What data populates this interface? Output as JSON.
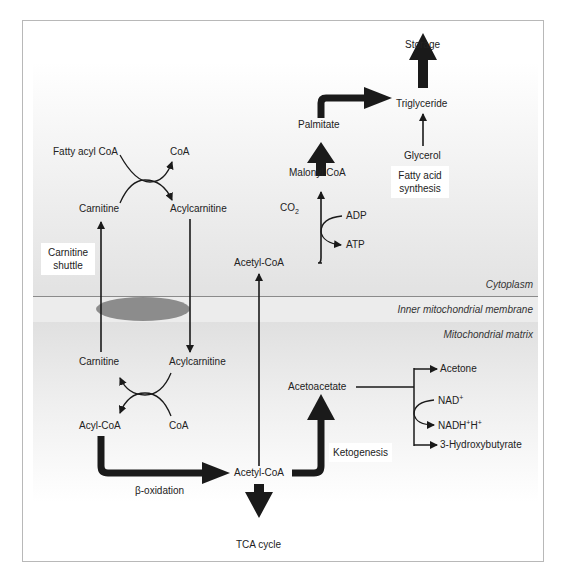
{
  "regions": {
    "cytoplasm": "Cytoplasm",
    "membrane": "Inner mitochondrial membrane",
    "matrix": "Mitochondrial matrix"
  },
  "cytoplasm_nodes": {
    "fatty_acyl_coa": "Fatty acyl CoA",
    "coa_top": "CoA",
    "carnitine_top": "Carnitine",
    "acylcarnitine_top": "Acylcarnitine",
    "acetyl_coa_top": "Acetyl-CoA",
    "co2_base": "CO",
    "co2_sub": "2",
    "adp": "ADP",
    "atp": "ATP",
    "malonyl_coa": "Malonyl CoA",
    "palmitate": "Palmitate",
    "triglyceride": "Triglyceride",
    "storage": "Storage",
    "glycerol": "Glycerol"
  },
  "boxes": {
    "carnitine_shuttle_line1": "Carnitine",
    "carnitine_shuttle_line2": "shuttle",
    "fatty_acid_synthesis_line1": "Fatty acid",
    "fatty_acid_synthesis_line2": "synthesis",
    "ketogenesis": "Ketogenesis"
  },
  "matrix_nodes": {
    "carnitine_bottom": "Carnitine",
    "acylcarnitine_bottom": "Acylcarnitine",
    "acyl_coa": "Acyl-CoA",
    "coa_bottom": "CoA",
    "beta_oxidation": "β-oxidation",
    "acetyl_coa_bottom": "Acetyl-CoA",
    "tca_cycle": "TCA cycle",
    "acetoacetate": "Acetoacetate",
    "acetone": "Acetone",
    "nad_base": "NAD",
    "nad_sup": "+",
    "nadh_base": "NADH",
    "nadh_sup1": "+",
    "nadh_mid": "H",
    "nadh_sup2": "+",
    "hydroxybutyrate": "3-Hydroxybutyrate"
  },
  "colors": {
    "arrow": "#1a1a1a",
    "membrane_line": "#8a8a8a",
    "transporter": "#8c8c8c",
    "frame_border": "#b8b8b8"
  }
}
